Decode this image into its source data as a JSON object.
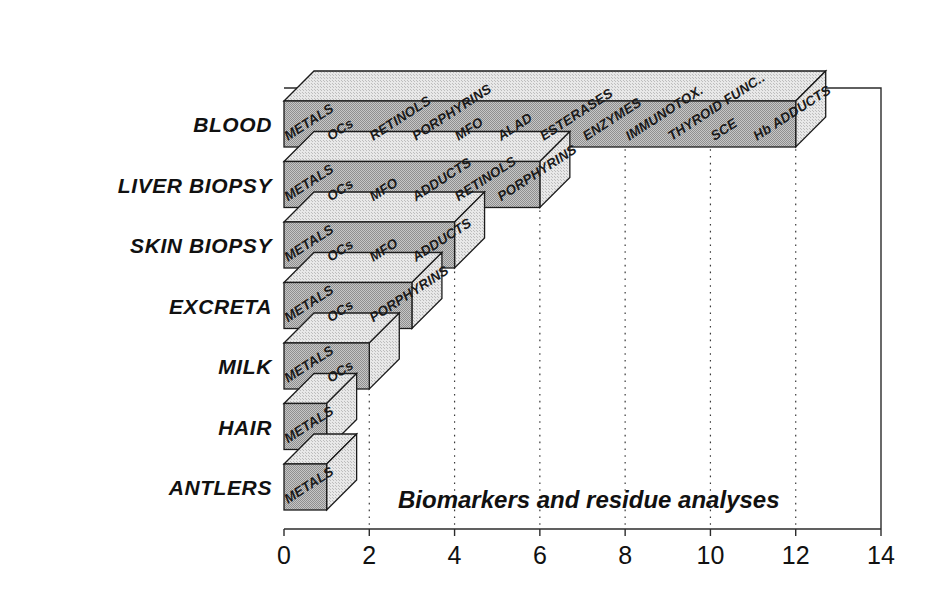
{
  "chart_data": {
    "type": "bar",
    "orientation": "horizontal",
    "style": "3d-bar",
    "title": "",
    "annotation": "Biomarkers and residue analyses",
    "xlabel": "",
    "ylabel": "",
    "xlim": [
      0,
      14
    ],
    "xticks": [
      "0",
      "2",
      "4",
      "6",
      "8",
      "10",
      "12",
      "14"
    ],
    "xtick_values": [
      0,
      2,
      4,
      6,
      8,
      10,
      12,
      14
    ],
    "grid": "vertical-dotted",
    "legend": "none",
    "categories": [
      "BLOOD",
      "LIVER BIOPSY",
      "SKIN BIOPSY",
      "EXCRETA",
      "MILK",
      "HAIR",
      "ANTLERS"
    ],
    "values": [
      12,
      6,
      4,
      3,
      2,
      1,
      1
    ],
    "series": [
      {
        "name": "Biomarkers and residue analyses",
        "values": [
          12,
          6,
          4,
          3,
          2,
          1,
          1
        ]
      }
    ],
    "segment_labels": [
      {
        "category": "BLOOD",
        "value": 12,
        "labels": [
          "METALS",
          "OCs",
          "RETINOLS",
          "PORPHYRINS",
          "MFO",
          "ALAD",
          "ESTERASES",
          "ENZYMES",
          "IMMUNOTOX.",
          "THYROID FUNC..",
          "SCE",
          "Hb ADDUCTS"
        ]
      },
      {
        "category": "LIVER BIOPSY",
        "value": 6,
        "labels": [
          "METALS",
          "OCs",
          "MFO",
          "ADDUCTS",
          "RETINOLS",
          "PORPHYRINS"
        ]
      },
      {
        "category": "SKIN BIOPSY",
        "value": 4,
        "labels": [
          "METALS",
          "OCs",
          "MFO",
          "ADDUCTS"
        ]
      },
      {
        "category": "EXCRETA",
        "value": 3,
        "labels": [
          "METALS",
          "OCs",
          "PORPHYRINS"
        ]
      },
      {
        "category": "MILK",
        "value": 2,
        "labels": [
          "METALS",
          "OCs"
        ]
      },
      {
        "category": "HAIR",
        "value": 1,
        "labels": [
          "METALS"
        ]
      },
      {
        "category": "ANTLERS",
        "value": 1,
        "labels": [
          "METALS"
        ]
      }
    ],
    "colors": {
      "bar_front": "#b4b4b4",
      "bar_side": "#dcdcdc",
      "bar_outline": "#1c1c1c",
      "text": "#111111",
      "background": "#ffffff",
      "grid": "#3a3a3a"
    }
  }
}
